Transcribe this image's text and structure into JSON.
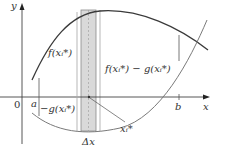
{
  "figure": {
    "axis_x_label": "x",
    "axis_y_label": "y",
    "origin_label": "0",
    "tick_a_label": "a",
    "tick_b_label": "b",
    "label_f": "f(xᵢ*)",
    "label_f_minus_g": "f(xᵢ*) − g(xᵢ*)",
    "label_neg_g": "−g(xᵢ*)",
    "label_xi_star": "xᵢ*",
    "label_delta_x": "Δx"
  },
  "colors": {
    "curve": "#3a3a3a",
    "curve_g": "#7a7a7a",
    "axis": "#444444",
    "strip_fill": "#d9d9d9",
    "strip_edge": "#8a8a8a"
  }
}
